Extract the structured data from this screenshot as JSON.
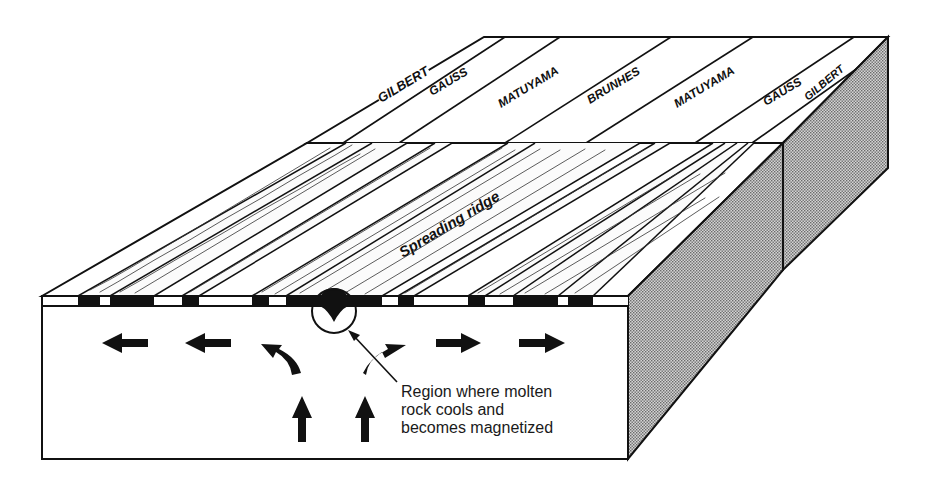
{
  "figure": {
    "type": "block diagram"
  },
  "colors": {
    "ink": "#111111",
    "background": "#ffffff",
    "side_shade": "#b8b8b8",
    "magnetized_band": "#111111"
  },
  "polarity_epochs": {
    "labels": [
      "GILBERT",
      "GAUSS",
      "MATUYAMA",
      "BRUNHES",
      "MATUYAMA",
      "GAUSS",
      "GILBERT"
    ],
    "items": [
      {
        "label": "GILBERT",
        "side": "left"
      },
      {
        "label": "GAUSS",
        "side": "left"
      },
      {
        "label": "MATUYAMA",
        "side": "left"
      },
      {
        "label": "BRUNHES",
        "side": "center"
      },
      {
        "label": "MATUYAMA",
        "side": "right"
      },
      {
        "label": "GAUSS",
        "side": "right"
      },
      {
        "label": "GILBERT",
        "side": "right"
      }
    ]
  },
  "surface_labels": {
    "ridge": "Spreading ridge"
  },
  "callout": {
    "line1": "Region where molten",
    "line2": "rock cools and",
    "line3": "becomes magnetized",
    "full_text": "Region where molten rock cools and becomes magnetized"
  },
  "flow_arrows": {
    "left_horizontal": 2,
    "right_horizontal": 2,
    "curved_upward": 2,
    "vertical_upward": 2
  },
  "magnetic_strip_pattern": [
    {
      "color": "white",
      "x0": 43,
      "x1": 78
    },
    {
      "color": "black",
      "x0": 78,
      "x1": 100
    },
    {
      "color": "white",
      "x0": 100,
      "x1": 110
    },
    {
      "color": "black",
      "x0": 110,
      "x1": 154
    },
    {
      "color": "white",
      "x0": 154,
      "x1": 182
    },
    {
      "color": "black",
      "x0": 182,
      "x1": 199
    },
    {
      "color": "white",
      "x0": 199,
      "x1": 252
    },
    {
      "color": "black",
      "x0": 252,
      "x1": 269
    },
    {
      "color": "white",
      "x0": 269,
      "x1": 286
    },
    {
      "color": "black",
      "x0": 286,
      "x1": 382
    },
    {
      "color": "white",
      "x0": 382,
      "x1": 398
    },
    {
      "color": "black",
      "x0": 398,
      "x1": 414
    },
    {
      "color": "white",
      "x0": 414,
      "x1": 468
    },
    {
      "color": "black",
      "x0": 468,
      "x1": 485
    },
    {
      "color": "white",
      "x0": 485,
      "x1": 513
    },
    {
      "color": "black",
      "x0": 513,
      "x1": 558
    },
    {
      "color": "white",
      "x0": 558,
      "x1": 568
    },
    {
      "color": "black",
      "x0": 568,
      "x1": 593
    },
    {
      "color": "white",
      "x0": 593,
      "x1": 628
    }
  ]
}
